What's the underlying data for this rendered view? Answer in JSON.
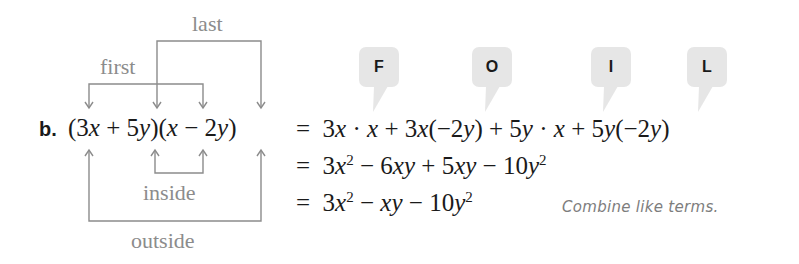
{
  "problem": {
    "part_label": "b.",
    "expression": {
      "open1": "(",
      "a_coef": "3",
      "a_var": "x",
      "plus": " + ",
      "b_coef": "5",
      "b_var": "y",
      "close1": ")",
      "open2": "(",
      "c_var": "x",
      "minus": " − ",
      "d_coef": "2",
      "d_var": "y",
      "close2": ")"
    }
  },
  "bracket_labels": {
    "first": "first",
    "last": "last",
    "inside": "inside",
    "outside": "outside"
  },
  "foil_bubbles": [
    {
      "letter": "F"
    },
    {
      "letter": "O"
    },
    {
      "letter": "I"
    },
    {
      "letter": "L"
    }
  ],
  "steps": [
    {
      "eq": "=",
      "terms": [
        {
          "c": "3",
          "v": "x",
          "rest": " · ",
          "v2": "x"
        },
        {
          "op": " + ",
          "c": "3",
          "v": "x",
          "paren": "(−2",
          "pv": "y",
          "pclose": ")"
        },
        {
          "op": " + ",
          "c": "5",
          "v": "y",
          "rest": " · ",
          "v2": "x"
        },
        {
          "op": " + ",
          "c": "5",
          "v": "y",
          "paren": "(−2",
          "pv": "y",
          "pclose": ")"
        }
      ]
    },
    {
      "eq": "=",
      "t1c": "3",
      "t1v": "x",
      "t1e": "2",
      "op1": " − ",
      "t2c": "6",
      "t2v": "xy",
      "op2": " + ",
      "t3c": "5",
      "t3v": "xy",
      "op3": " − ",
      "t4c": "10",
      "t4v": "y",
      "t4e": "2"
    },
    {
      "eq": "=",
      "t1c": "3",
      "t1v": "x",
      "t1e": "2",
      "op1": " − ",
      "t2v": "xy",
      "op2": " − ",
      "t3c": "10",
      "t3v": "y",
      "t3e": "2",
      "note": "Combine like terms."
    }
  ],
  "colors": {
    "annotation_gray": "#8c8c8c",
    "bubble_fill": "#e6e6e6",
    "text": "#1a1a1a"
  }
}
